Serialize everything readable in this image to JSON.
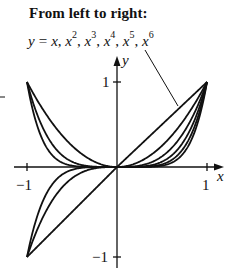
{
  "caption": {
    "title": "From left to right:",
    "lhs": "y",
    "equals": "=",
    "terms": [
      {
        "base": "x",
        "exp": ""
      },
      {
        "base": "x",
        "exp": "2"
      },
      {
        "base": "x",
        "exp": "3"
      },
      {
        "base": "x",
        "exp": "4"
      },
      {
        "base": "x",
        "exp": "5"
      },
      {
        "base": "x",
        "exp": "6"
      }
    ]
  },
  "axes": {
    "x_label": "x",
    "y_label": "y",
    "x_ticks": [
      {
        "value": -1,
        "label": "−1"
      },
      {
        "value": 1,
        "label": "1"
      }
    ],
    "y_ticks": [
      {
        "value": 1,
        "label": "1"
      },
      {
        "value": -1,
        "label": "−1"
      }
    ]
  },
  "colors": {
    "stroke": "#111111",
    "background": "#ffffff"
  },
  "chart_data": {
    "type": "line",
    "xlabel": "x",
    "ylabel": "y",
    "xlim": [
      -1,
      1
    ],
    "ylim": [
      -1,
      1
    ],
    "grid": false,
    "legend": "none (caption with leader line pointing to curves)",
    "series": [
      {
        "name": "y = x",
        "exponent": 1
      },
      {
        "name": "y = x^2",
        "exponent": 2
      },
      {
        "name": "y = x^3",
        "exponent": 3
      },
      {
        "name": "y = x^4",
        "exponent": 4
      },
      {
        "name": "y = x^5",
        "exponent": 5
      },
      {
        "name": "y = x^6",
        "exponent": 6
      }
    ],
    "x": [
      -1,
      -0.75,
      -0.5,
      -0.25,
      0,
      0.25,
      0.5,
      0.75,
      1
    ]
  }
}
